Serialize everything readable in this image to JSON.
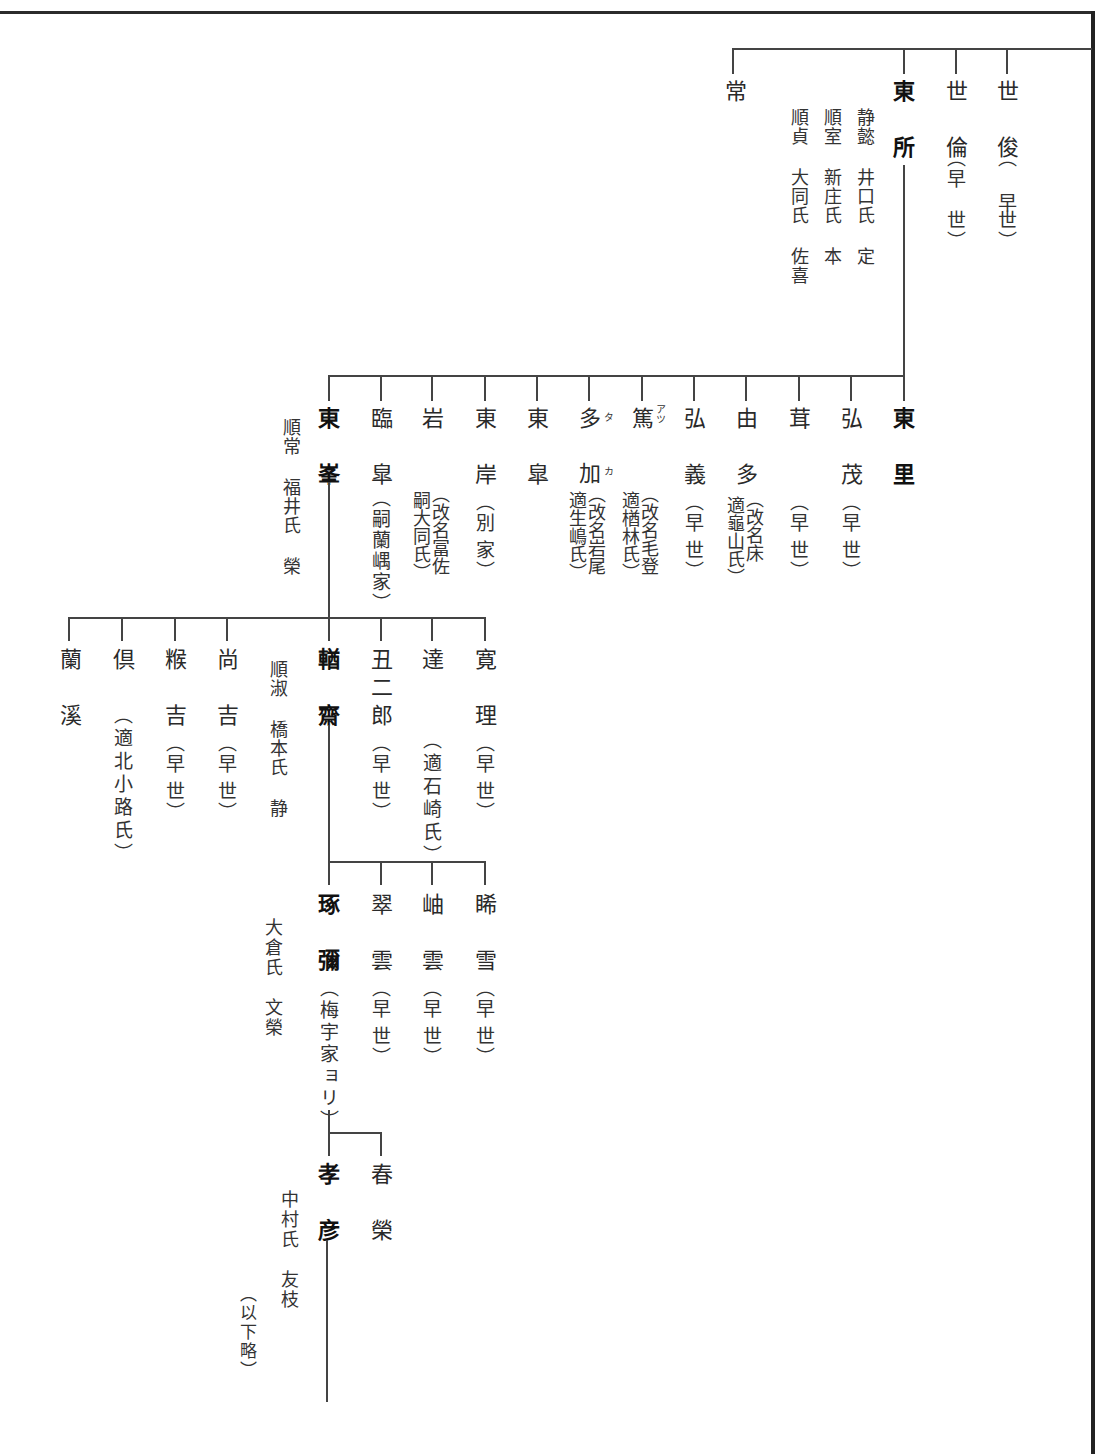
{
  "figure": {
    "type": "genealogy-tree",
    "orientation": "vertical-right-to-left",
    "generation_1": {
      "members": [
        {
          "id": "toshi",
          "name": "世俊",
          "note": "（早世）"
        },
        {
          "id": "yorin",
          "name": "世倫",
          "note": "（早世）"
        },
        {
          "id": "tosho",
          "name": "東所",
          "note": "",
          "bold": true,
          "spouses": [
            "静懿 井口氏 定",
            "順室 新庄氏 本",
            "順貞 大同氏 佐喜"
          ]
        },
        {
          "id": "jo",
          "name": "常",
          "note": ""
        }
      ]
    },
    "generation_2": {
      "parent": "東所",
      "members": [
        {
          "name": "東里",
          "note": "",
          "bold": true
        },
        {
          "name": "弘茂",
          "note": "（早世）"
        },
        {
          "name": "茸",
          "note": "（早世）"
        },
        {
          "name": "由多",
          "note": "（改名床 適龜山氏）"
        },
        {
          "name": "弘義",
          "note": "（早世）"
        },
        {
          "name": "篤",
          "ruby": "アツ",
          "note": "（改名毛登 適楢林氏）"
        },
        {
          "name": "多加",
          "ruby": [
            "タ",
            "カ"
          ],
          "note": "（改名岩尾 適生嶋氏）"
        },
        {
          "name": "東皐",
          "note": ""
        },
        {
          "name": "東岸",
          "note": "（別家）"
        },
        {
          "name": "岩",
          "note": "（改名冨佐 嗣大同氏）"
        },
        {
          "name": "臨皐",
          "note": "（嗣蘭嵎家）"
        },
        {
          "name": "東峯",
          "note": "",
          "bold": true,
          "spouse": "順常 福井氏 榮"
        }
      ]
    },
    "generation_3": {
      "parent": "東峯",
      "members": [
        {
          "name": "寛理",
          "note": "（早世）"
        },
        {
          "name": "達",
          "note": "（適石崎氏）"
        },
        {
          "name": "丑二郎",
          "note": "（早世）"
        },
        {
          "name": "輶齋",
          "note": "",
          "bold": true,
          "spouse": "順淑 橋本氏 静"
        },
        {
          "name": "尚吉",
          "note": "（早世）"
        },
        {
          "name": "糇吉",
          "note": "（早世）"
        },
        {
          "name": "倶",
          "note": "（適北小路氏）"
        },
        {
          "name": "蘭溪",
          "note": ""
        }
      ]
    },
    "generation_4": {
      "parent": "輶齋",
      "members": [
        {
          "name": "睎雪",
          "note": "（早世）"
        },
        {
          "name": "岫雲",
          "note": "（早世）"
        },
        {
          "name": "翠雲",
          "note": "（早世）"
        },
        {
          "name": "琢彌",
          "note": "（梅宇家ヨリ）",
          "bold": true,
          "spouse": "大倉氏 文榮"
        }
      ]
    },
    "generation_5": {
      "parent": "琢彌",
      "members": [
        {
          "name": "春榮",
          "note": ""
        },
        {
          "name": "孝彦",
          "note": "",
          "bold": true,
          "spouse": "中村氏 友枝"
        }
      ]
    },
    "footer_note": "（以下略）"
  },
  "g1": {
    "c1": "世俊",
    "c1n": "（早",
    "c1n2": "世）",
    "c2": "世倫",
    "c2n": "（早",
    "c2n2": "世）",
    "c3": "東所",
    "s1": "静懿 井口氏 定",
    "s2": "順室 新庄氏 本",
    "s3": "順貞 大同氏 佐喜",
    "c4": "常"
  },
  "g2": {
    "c1": "東里",
    "c2": "弘茂",
    "c2n": "（早",
    "c2n2": "世）",
    "c3": "茸",
    "c3n": "（早",
    "c3n2": "世）",
    "c4": "由多",
    "c4n": "（改名床\n 適龜山氏）",
    "c5": "弘義",
    "c5n": "（早",
    "c5n2": "世）",
    "c6": "篤",
    "c6r": "アツ",
    "c6n": "（改名毛登\n 適楢林氏）",
    "c7a": "多",
    "c7ra": "タ",
    "c7b": "加",
    "c7rb": "カ",
    "c7n": "（改名岩尾\n 適生嶋氏）",
    "c8": "東皐",
    "c9": "東岸",
    "c9n": "（別",
    "c9n2": "家）",
    "c10": "岩",
    "c10n": "（改名冨佐\n 嗣大同氏）",
    "c11": "臨皐",
    "c11n": "（嗣蘭嵎家）",
    "c12": "東峯",
    "s12": "順常 福井氏 榮"
  },
  "g3": {
    "c1": "寛理",
    "c1n": "（早",
    "c1n2": "世）",
    "c2": "達",
    "c2n": "（適石崎氏）",
    "c3": "丑二郎",
    "c3n": "（早",
    "c3n2": "世）",
    "c4": "輶齋",
    "s4": "順淑 橋本氏 静",
    "c5": "尚吉",
    "c5n": "（早",
    "c5n2": "世）",
    "c6": "糇吉",
    "c6n": "（早",
    "c6n2": "世）",
    "c7": "倶",
    "c7n": "（適北小路氏）",
    "c8": "蘭溪"
  },
  "g4": {
    "c1": "睎雪",
    "c1n": "（早",
    "c1n2": "世）",
    "c2": "岫雲",
    "c2n": "（早",
    "c2n2": "世）",
    "c3": "翠雲",
    "c3n": "（早",
    "c3n2": "世）",
    "c4": "琢彌",
    "c4n": "（梅宇家ョリ）",
    "s4": "大倉氏　文榮"
  },
  "g5": {
    "c1": "春榮",
    "c2": "孝彦",
    "s2": "中村氏　友枝"
  },
  "footer": "（以下略）"
}
